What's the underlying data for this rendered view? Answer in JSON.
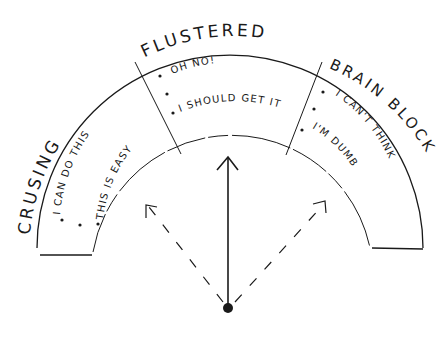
{
  "diagram": {
    "type": "gauge",
    "ink_color": "#1a1a1a",
    "background": "#ffffff",
    "zones": [
      {
        "label": "CRUSING",
        "statements": [
          "I CAN DO THIS",
          "THIS IS EASY"
        ]
      },
      {
        "label": "FLUSTERED",
        "statements": [
          "OH NO!",
          "I SHOULD GET IT"
        ]
      },
      {
        "label": "BRAIN BLOCK",
        "statements": [
          "I CAN'T THINK",
          "I'M DUMB"
        ]
      }
    ],
    "needle": {
      "main": "solid arrow pointing up (center)",
      "alternates": [
        "dashed arrow pointing up-left",
        "dashed arrow pointing up-right"
      ]
    }
  }
}
